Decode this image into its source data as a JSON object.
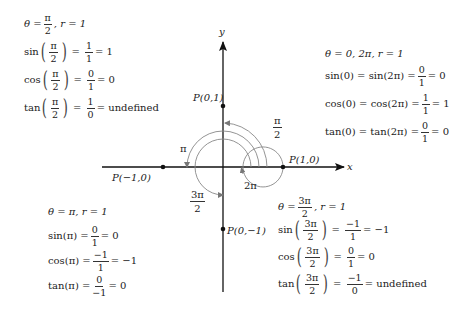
{
  "diagram": {
    "axes": {
      "x_label": "x",
      "y_label": "y"
    },
    "points": [
      {
        "label": "P(0,1)",
        "x": 0,
        "y": 1
      },
      {
        "label": "P(1,0)",
        "x": 1,
        "y": 0
      },
      {
        "label": "P(−1,0)",
        "x": -1,
        "y": 0
      },
      {
        "label": "P(0,−1)",
        "x": 0,
        "y": -1
      }
    ],
    "arc_labels": {
      "half_pi": {
        "num": "π",
        "den": "2"
      },
      "pi": "π",
      "three_half_pi": {
        "num": "3π",
        "den": "2"
      },
      "two_pi": "2π"
    }
  },
  "blocks": {
    "top_left": {
      "header": {
        "theta": "θ =",
        "num": "π",
        "den": "2",
        "r": ",  r = 1"
      },
      "sin": {
        "fn": "sin",
        "arg_num": "π",
        "arg_den": "2",
        "num": "1",
        "den": "1",
        "result": "= 1"
      },
      "cos": {
        "fn": "cos",
        "arg_num": "π",
        "arg_den": "2",
        "num": "0",
        "den": "1",
        "result": "= 0"
      },
      "tan": {
        "fn": "tan",
        "arg_num": "π",
        "arg_den": "2",
        "num": "1",
        "den": "0",
        "result": "=  undefined"
      }
    },
    "top_right": {
      "header": "θ = 0, 2π, r = 1",
      "sin": {
        "lhs": "sin(0) = sin(2π) =",
        "num": "0",
        "den": "1",
        "result": "= 0"
      },
      "cos": {
        "lhs": "cos(0) = cos(2π) =",
        "num": "1",
        "den": "1",
        "result": "= 1"
      },
      "tan": {
        "lhs": "tan(0) = tan(2π) =",
        "num": "0",
        "den": "1",
        "result": "= 0"
      }
    },
    "bottom_left": {
      "header": "θ = π, r = 1",
      "sin": {
        "lhs": "sin(π) =",
        "num": "0",
        "den": "1",
        "result": "= 0"
      },
      "cos": {
        "lhs": "cos(π) =",
        "num": "−1",
        "den": "1",
        "result": "= −1"
      },
      "tan": {
        "lhs": "tan(π) =",
        "num": "0",
        "den": "−1",
        "result": "= 0"
      }
    },
    "bottom_right": {
      "header": {
        "theta": "θ =",
        "num": "3π",
        "den": "2",
        "r": ", r = 1"
      },
      "sin": {
        "fn": "sin",
        "arg_num": "3π",
        "arg_den": "2",
        "num": "−1",
        "den": "1",
        "result": "= −1"
      },
      "cos": {
        "fn": "cos",
        "arg_num": "3π",
        "arg_den": "2",
        "num": "0",
        "den": "1",
        "result": "= 0"
      },
      "tan": {
        "fn": "tan",
        "arg_num": "3π",
        "arg_den": "2",
        "num": "−1",
        "den": "0",
        "result": "=  undefined"
      }
    }
  }
}
